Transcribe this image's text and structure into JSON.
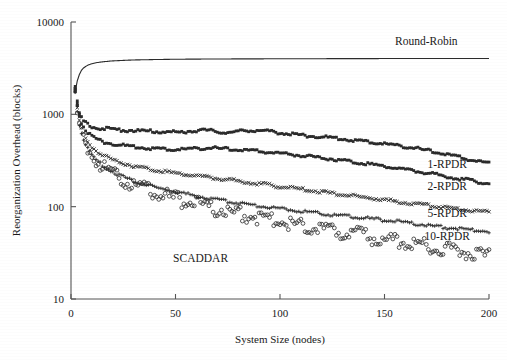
{
  "chart_data": {
    "type": "scatter",
    "title": "",
    "xlabel": "System Size (nodes)",
    "ylabel": "Reorganization Overhead (blocks)",
    "xlim": [
      0,
      200
    ],
    "ylim": [
      10,
      10000
    ],
    "yscale": "log",
    "xscale": "linear",
    "xticks": [
      0,
      50,
      100,
      150,
      200
    ],
    "yticks": [
      10,
      100,
      1000,
      10000
    ],
    "xticklabels": [
      "0",
      "50",
      "100",
      "150",
      "200"
    ],
    "yticklabels": [
      "10",
      "100",
      "1000",
      "10000"
    ],
    "grid": false,
    "legend_position": "inline-right-annotations",
    "series": [
      {
        "name": "Round-Robin",
        "marker": "line",
        "label_x": 170,
        "label_y": 5600,
        "x": [
          2,
          3,
          4,
          5,
          6,
          7,
          8,
          9,
          10,
          12,
          14,
          16,
          18,
          20,
          25,
          30,
          35,
          40,
          50,
          60,
          70,
          80,
          90,
          100,
          110,
          120,
          130,
          140,
          150,
          160,
          170,
          180,
          190,
          200
        ],
        "y": [
          1750,
          2300,
          2700,
          3000,
          3180,
          3300,
          3400,
          3470,
          3530,
          3620,
          3680,
          3720,
          3760,
          3790,
          3840,
          3880,
          3900,
          3920,
          3950,
          3965,
          3975,
          3985,
          3990,
          3998,
          4002,
          4006,
          4010,
          4014,
          4018,
          4020,
          4023,
          4026,
          4028,
          4030
        ]
      },
      {
        "name": "1-RPDR",
        "marker": "square",
        "label_x": 180,
        "label_y": 260,
        "x": [
          2,
          3,
          4,
          5,
          6,
          7,
          8,
          9,
          10,
          11,
          12,
          13,
          14,
          15,
          16,
          17,
          18,
          19,
          20,
          22,
          24,
          26,
          28,
          30,
          32,
          34,
          36,
          38,
          40,
          44,
          48,
          52,
          56,
          60,
          64,
          68,
          72,
          76,
          80,
          85,
          90,
          95,
          100,
          105,
          110,
          115,
          120,
          125,
          130,
          135,
          140,
          145,
          150,
          155,
          160,
          165,
          170,
          175,
          180,
          185,
          190,
          195,
          200
        ],
        "y": [
          1900,
          1320,
          1000,
          900,
          830,
          790,
          760,
          740,
          725,
          715,
          705,
          700,
          695,
          690,
          687,
          684,
          680,
          677,
          675,
          670,
          665,
          660,
          658,
          655,
          650,
          648,
          645,
          642,
          640,
          635,
          630,
          628,
          640,
          655,
          660,
          648,
          630,
          620,
          640,
          660,
          655,
          640,
          620,
          600,
          585,
          570,
          560,
          545,
          530,
          515,
          500,
          485,
          470,
          455,
          440,
          420,
          400,
          380,
          360,
          340,
          320,
          305,
          290
        ]
      },
      {
        "name": "2-RPDR",
        "marker": "square",
        "label_x": 180,
        "label_y": 150,
        "x": [
          2,
          3,
          4,
          5,
          6,
          7,
          8,
          9,
          10,
          11,
          12,
          13,
          14,
          15,
          16,
          18,
          20,
          22,
          24,
          26,
          28,
          30,
          34,
          38,
          42,
          46,
          50,
          55,
          60,
          65,
          70,
          75,
          80,
          85,
          90,
          95,
          100,
          105,
          110,
          115,
          120,
          125,
          130,
          135,
          140,
          145,
          150,
          155,
          160,
          165,
          170,
          175,
          180,
          185,
          190,
          195,
          200
        ],
        "y": [
          1850,
          1250,
          950,
          800,
          720,
          660,
          620,
          590,
          570,
          550,
          535,
          520,
          510,
          500,
          492,
          480,
          470,
          462,
          455,
          448,
          442,
          437,
          428,
          420,
          414,
          410,
          408,
          412,
          420,
          425,
          420,
          412,
          405,
          398,
          390,
          382,
          372,
          362,
          352,
          342,
          332,
          322,
          312,
          300,
          290,
          280,
          270,
          258,
          248,
          238,
          228,
          218,
          208,
          198,
          190,
          182,
          175
        ]
      },
      {
        "name": "5-RPDR",
        "marker": "x",
        "label_x": 180,
        "label_y": 78,
        "x": [
          2,
          3,
          4,
          5,
          6,
          7,
          8,
          9,
          10,
          11,
          12,
          14,
          16,
          18,
          20,
          22,
          25,
          28,
          31,
          34,
          37,
          40,
          44,
          48,
          52,
          56,
          60,
          65,
          70,
          75,
          80,
          85,
          90,
          95,
          100,
          105,
          110,
          115,
          120,
          125,
          130,
          135,
          140,
          145,
          150,
          155,
          160,
          165,
          170,
          175,
          180,
          185,
          190,
          195,
          200
        ],
        "y": [
          1780,
          1150,
          840,
          690,
          600,
          540,
          495,
          462,
          436,
          415,
          398,
          370,
          348,
          330,
          316,
          304,
          290,
          278,
          268,
          260,
          252,
          246,
          238,
          230,
          224,
          218,
          212,
          205,
          198,
          192,
          186,
          180,
          174,
          168,
          162,
          157,
          152,
          147,
          142,
          137,
          133,
          128,
          124,
          120,
          116,
          112,
          108,
          105,
          102,
          99,
          96,
          93,
          90,
          88,
          86
        ]
      },
      {
        "name": "10-RPDR",
        "marker": "plus",
        "label_x": 180,
        "label_y": 44,
        "x": [
          2,
          3,
          4,
          5,
          6,
          7,
          8,
          9,
          10,
          11,
          12,
          14,
          16,
          18,
          20,
          23,
          26,
          29,
          32,
          36,
          40,
          44,
          48,
          52,
          56,
          60,
          65,
          70,
          75,
          80,
          85,
          90,
          95,
          100,
          105,
          110,
          115,
          120,
          125,
          130,
          135,
          140,
          145,
          150,
          155,
          160,
          165,
          170,
          175,
          180,
          185,
          190,
          195,
          200
        ],
        "y": [
          1740,
          1080,
          760,
          610,
          520,
          460,
          415,
          382,
          356,
          334,
          316,
          288,
          266,
          248,
          234,
          216,
          202,
          190,
          180,
          169,
          160,
          152,
          145,
          139,
          133,
          128,
          122,
          117,
          112,
          108,
          104,
          100,
          97,
          94,
          91,
          88,
          85,
          83,
          80,
          78,
          76,
          74,
          72,
          70,
          68,
          66,
          64,
          62,
          60,
          58,
          57,
          55,
          54,
          53
        ]
      },
      {
        "name": "SCADDAR",
        "marker": "circle",
        "label_x": 62,
        "label_y": 25,
        "x": [
          3,
          4,
          5,
          6,
          7,
          8,
          9,
          10,
          11,
          12,
          13,
          14,
          15,
          16,
          17,
          18,
          19,
          20,
          21,
          22,
          23,
          24,
          25,
          26,
          27,
          28,
          29,
          30,
          32,
          34,
          36,
          38,
          40,
          42,
          44,
          46,
          48,
          50,
          52,
          54,
          56,
          58,
          60,
          62,
          64,
          66,
          68,
          70,
          72,
          74,
          76,
          78,
          80,
          82,
          84,
          86,
          88,
          90,
          92,
          94,
          96,
          98,
          100,
          102,
          104,
          106,
          108,
          110,
          112,
          114,
          116,
          118,
          120,
          122,
          124,
          126,
          128,
          130,
          132,
          134,
          136,
          138,
          140,
          142,
          144,
          146,
          148,
          150,
          152,
          154,
          156,
          158,
          160,
          162,
          164,
          166,
          168,
          170,
          172,
          174,
          176,
          178,
          180,
          182,
          184,
          186,
          188,
          190,
          192,
          194,
          196,
          198,
          200
        ],
        "y": [
          900,
          700,
          580,
          500,
          440,
          400,
          365,
          340,
          318,
          300,
          284,
          270,
          258,
          246,
          236,
          227,
          219,
          211,
          204,
          198,
          192,
          186,
          181,
          176,
          171,
          167,
          163,
          159,
          152,
          146,
          140,
          135,
          130,
          126,
          122,
          118,
          115,
          111,
          108,
          105,
          102,
          100,
          97,
          95,
          92,
          90,
          88,
          86,
          84,
          82,
          80,
          79,
          77,
          75,
          74,
          72,
          71,
          69,
          68,
          67,
          65,
          64,
          63,
          62,
          61,
          60,
          59,
          58,
          57,
          56,
          55,
          54,
          53,
          52,
          51,
          50,
          49,
          48,
          47,
          46,
          46,
          45,
          44,
          43,
          42,
          42,
          41,
          40,
          40,
          39,
          38,
          38,
          37,
          36,
          36,
          35,
          35,
          34,
          34,
          33,
          33,
          32,
          32,
          31,
          31,
          30,
          30,
          29,
          29,
          28,
          28,
          27,
          27
        ]
      }
    ],
    "annotations": [
      {
        "text": "Round-Robin",
        "x": 170,
        "y": 5600
      },
      {
        "text": "1-RPDR",
        "x": 180,
        "y": 260
      },
      {
        "text": "2-RPDR",
        "x": 180,
        "y": 150
      },
      {
        "text": "5-RPDR",
        "x": 180,
        "y": 78
      },
      {
        "text": "10-RPDR",
        "x": 180,
        "y": 44
      },
      {
        "text": "SCADDAR",
        "x": 62,
        "y": 25
      }
    ],
    "colors": {
      "axis": "#555555",
      "text": "#1a1a1a",
      "marker": "#2b2b2b",
      "background": "#ffffff"
    }
  }
}
